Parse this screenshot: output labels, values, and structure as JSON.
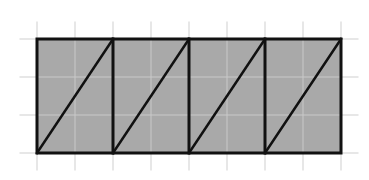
{
  "diagram": {
    "grid": {
      "cell_size": 38,
      "origin_x": 37,
      "origin_y": 39,
      "columns": 8,
      "rows": 3,
      "overhang": 17,
      "line_color": "#cfcfcf",
      "inner_line_color": "#c9c9c9"
    },
    "rectangle": {
      "fill": "#a9a9a9",
      "stroke": "#111111",
      "stroke_width": 3,
      "width_cells": 8,
      "height_cells": 3
    },
    "panels": [
      {
        "index": 1,
        "x_start_cell": 0,
        "width_cells": 2,
        "diagonal": "bottom-left to top-right"
      },
      {
        "index": 2,
        "x_start_cell": 2,
        "width_cells": 2,
        "diagonal": "bottom-left to top-right"
      },
      {
        "index": 3,
        "x_start_cell": 4,
        "width_cells": 2,
        "diagonal": "bottom-left to top-right"
      },
      {
        "index": 4,
        "x_start_cell": 6,
        "width_cells": 2,
        "diagonal": "bottom-left to top-right"
      }
    ]
  }
}
